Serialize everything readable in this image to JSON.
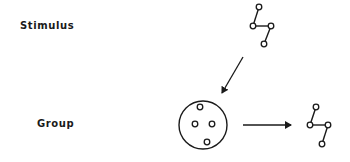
{
  "labels": {
    "stimulus": "Stimulus",
    "group": "Group"
  },
  "colors": {
    "ink": "#1a1a1a",
    "background": "#ffffff"
  },
  "figures": {
    "stimulus_structure": {
      "nodes": [
        [
          259,
          7
        ],
        [
          253,
          26
        ],
        [
          271,
          26
        ],
        [
          264,
          44
        ]
      ],
      "edges": [
        [
          0,
          1
        ],
        [
          1,
          2
        ],
        [
          2,
          3
        ]
      ]
    },
    "group_circle": {
      "center": [
        203,
        125
      ],
      "radius": 24,
      "members": [
        [
          200,
          107
        ],
        [
          195,
          124
        ],
        [
          212,
          124
        ],
        [
          207,
          142
        ]
      ]
    },
    "output_structure": {
      "nodes": [
        [
          316,
          107
        ],
        [
          310,
          125
        ],
        [
          328,
          125
        ],
        [
          322,
          144
        ]
      ],
      "edges": [
        [
          0,
          1
        ],
        [
          1,
          2
        ],
        [
          2,
          3
        ]
      ]
    },
    "arrows": [
      {
        "name": "stimulus-to-group-arrow",
        "from": [
          243,
          57
        ],
        "to": [
          222,
          93
        ]
      },
      {
        "name": "group-to-output-arrow",
        "from": [
          243,
          125
        ],
        "to": [
          291,
          125
        ]
      }
    ]
  }
}
